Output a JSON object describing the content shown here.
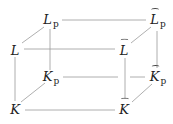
{
  "diagram": {
    "type": "commutative-cube",
    "nodes": {
      "Lp": {
        "base": "L",
        "sub": "p",
        "hat": false,
        "x": 50,
        "y": 23
      },
      "Lhp": {
        "base": "L",
        "sub": "p",
        "hat": true,
        "x": 157,
        "y": 23
      },
      "L": {
        "base": "L",
        "sub": "",
        "hat": false,
        "x": 15,
        "y": 50
      },
      "Lh": {
        "base": "L",
        "sub": "",
        "hat": true,
        "x": 125,
        "y": 50
      },
      "Kp": {
        "base": "K",
        "sub": "p",
        "hat": false,
        "x": 50,
        "y": 78
      },
      "Khp": {
        "base": "K",
        "sub": "p",
        "hat": true,
        "x": 157,
        "y": 78
      },
      "K": {
        "base": "K",
        "sub": "",
        "hat": false,
        "x": 15,
        "y": 108
      },
      "Kh": {
        "base": "K",
        "sub": "",
        "hat": true,
        "x": 125,
        "y": 108
      }
    },
    "edges": [
      [
        "Lp",
        "Lhp"
      ],
      [
        "L",
        "Lh"
      ],
      [
        "Kp",
        "Khp"
      ],
      [
        "K",
        "Kh"
      ],
      [
        "Lp",
        "L"
      ],
      [
        "Lhp",
        "Lh"
      ],
      [
        "Kp",
        "K"
      ],
      [
        "Khp",
        "Kh"
      ],
      [
        "Lp",
        "Kp"
      ],
      [
        "Lhp",
        "Khp"
      ],
      [
        "L",
        "K"
      ],
      [
        "Lh",
        "Kh"
      ]
    ],
    "edge_color": "#9a9a9a"
  }
}
